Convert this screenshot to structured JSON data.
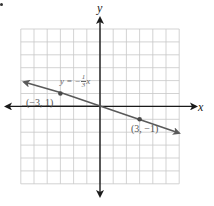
{
  "chart_data": {
    "type": "line",
    "title": "",
    "xlabel": "x",
    "ylabel": "y",
    "xlim": [
      -6,
      6
    ],
    "ylim": [
      -6,
      6
    ],
    "grid": true,
    "legend": null,
    "series": [
      {
        "name": "y = -1/3 x",
        "equation": "y = -⅓x",
        "slope": -0.3333,
        "intercept": 0,
        "x": [
          -6,
          -3,
          0,
          3,
          6
        ],
        "y": [
          2,
          1,
          0,
          -1,
          -2
        ],
        "color": "#5a5a5a"
      }
    ],
    "points": [
      {
        "label": "(−3, 1)",
        "x": -3,
        "y": 1
      },
      {
        "label": "(3, −1)",
        "x": 3,
        "y": -1
      }
    ],
    "annotations": [
      {
        "text": "y = −⅓x",
        "near": [
          -2.5,
          2
        ]
      }
    ]
  },
  "labels": {
    "x_axis": "x",
    "y_axis": "y",
    "equation_prefix": "y = −",
    "equation_num": "1",
    "equation_den": "3",
    "equation_var": "x",
    "point_a": "(−3, 1)",
    "point_b": "(3, −1)"
  },
  "colors": {
    "grid": "#c8c8c8",
    "axis": "#1a1a1a",
    "line": "#5a5a5a",
    "point": "#4a4a4a"
  }
}
